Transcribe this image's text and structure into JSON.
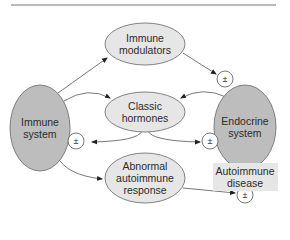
{
  "diagram": {
    "nodes": {
      "immune_system": {
        "label": "Immune system",
        "line1": "Immune",
        "line2": "system"
      },
      "endocrine_system": {
        "label": "Endocrine system",
        "line1": "Endocrine",
        "line2": "system"
      },
      "immune_modulators": {
        "label": "Immune modulators",
        "line1": "Immune",
        "line2": "modulators"
      },
      "classic_hormones": {
        "label": "Classic hormones",
        "line1": "Classic",
        "line2": "hormones"
      },
      "abnormal_response": {
        "label": "Abnormal autoimmune response",
        "line1": "Abnormal",
        "line2": "autoimmune",
        "line3": "response"
      },
      "autoimmune_disease": {
        "label": "Autoimmune disease",
        "line1": "Autoimmune",
        "line2": "disease"
      }
    },
    "modulation_symbol": "±",
    "edges": [
      {
        "from": "Immune system",
        "to": "Immune modulators"
      },
      {
        "from": "Immune modulators",
        "to": "Endocrine system",
        "modulation": "±"
      },
      {
        "from": "Immune system",
        "to": "Classic hormones"
      },
      {
        "from": "Endocrine system",
        "to": "Classic hormones"
      },
      {
        "from": "Classic hormones",
        "to": "Immune system",
        "modulation": "±"
      },
      {
        "from": "Classic hormones",
        "to": "Endocrine system",
        "modulation": "±"
      },
      {
        "from": "Immune system",
        "to": "Abnormal autoimmune response"
      },
      {
        "from": "Abnormal autoimmune response",
        "to": "Autoimmune disease",
        "modulation": "±"
      }
    ],
    "colors": {
      "system_fill": "#bdbdbd",
      "node_fill": "#e6e6e6",
      "stroke": "#555555",
      "rule": "#777777"
    }
  }
}
